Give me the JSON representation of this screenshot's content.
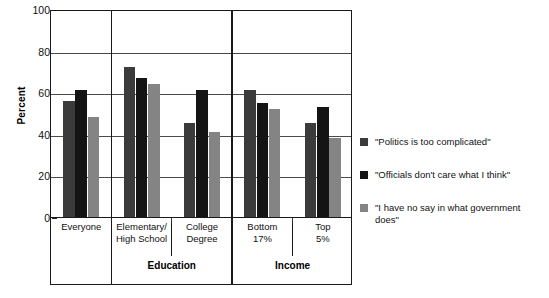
{
  "chart_data": {
    "type": "bar",
    "title": "",
    "xlabel": "",
    "ylabel": "Percent",
    "ylim": [
      0,
      100
    ],
    "yticks": [
      0,
      20,
      40,
      60,
      80,
      100
    ],
    "grid": true,
    "legend_position": "right",
    "categories": [
      "Everyone",
      "Elementary/\nHigh School",
      "College\nDegree",
      "Bottom\n17%",
      "Top\n5%"
    ],
    "category_lines": [
      [
        "Everyone"
      ],
      [
        "Elementary/",
        "High School"
      ],
      [
        "College",
        "Degree"
      ],
      [
        "Bottom",
        "17%"
      ],
      [
        "Top",
        "5%"
      ]
    ],
    "group_brackets": [
      {
        "label": "",
        "categories": [
          "Everyone"
        ]
      },
      {
        "label": "Education",
        "categories": [
          "Elementary/High School",
          "College Degree"
        ]
      },
      {
        "label": "Income",
        "categories": [
          "Bottom 17%",
          "Top 5%"
        ]
      }
    ],
    "series": [
      {
        "name": "\"Politics is too complicated\"",
        "color": "#3b3b3b",
        "values": [
          56,
          72,
          45,
          61,
          45
        ]
      },
      {
        "name": "\"Officials don't care what I think\"",
        "color": "#141414",
        "values": [
          61,
          67,
          61,
          55,
          53
        ]
      },
      {
        "name": "\"I have no say in what government does\"",
        "color": "#848484",
        "values": [
          48,
          64,
          41,
          52,
          38
        ]
      }
    ]
  },
  "axis": {
    "y_title": "Percent",
    "y_tick_labels": [
      "100",
      "80",
      "60",
      "40",
      "20",
      "0"
    ]
  },
  "legend": {
    "items": [
      {
        "label": "\"Politics is too complicated\"",
        "color": "#3b3b3b"
      },
      {
        "label": "\"Officials don't care what I think\"",
        "color": "#141414"
      },
      {
        "label": "\"I have no say in what government does\"",
        "color": "#848484"
      }
    ]
  },
  "brackets": {
    "education_label": "Education",
    "income_label": "Income"
  }
}
